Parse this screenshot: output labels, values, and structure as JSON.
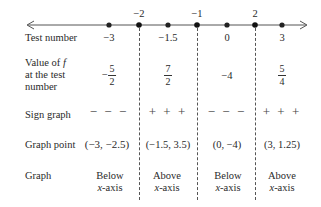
{
  "number_line": {
    "critical_labels": [
      "−2",
      "−1",
      "2"
    ],
    "points": [
      -3,
      -2,
      -1.5,
      -1,
      0,
      2,
      3
    ]
  },
  "rows": {
    "test_number": {
      "label": "Test number",
      "values": [
        "−3",
        "−1.5",
        "0",
        "3"
      ]
    },
    "value_of_f": {
      "label_line1": "Value of",
      "label_f": "f",
      "label_line2": "at the test",
      "label_line3": "number",
      "values": [
        {
          "sign": "−",
          "num": "5",
          "den": "2"
        },
        {
          "sign": "",
          "num": "7",
          "den": "2"
        },
        {
          "plain": "−4"
        },
        {
          "sign": "",
          "num": "5",
          "den": "4"
        }
      ]
    },
    "sign_graph": {
      "label": "Sign graph",
      "values": [
        "− − −",
        "+ + +",
        "− − −",
        "+ + +"
      ]
    },
    "graph_point": {
      "label": "Graph point",
      "values": [
        "(−3, −2.5)",
        "(−1.5, 3.5)",
        "(0, −4)",
        "(3, 1.25)"
      ]
    },
    "graph": {
      "label": "Graph",
      "values": [
        {
          "line1": "Below",
          "line2": "x-axis"
        },
        {
          "line1": "Above",
          "line2": "x-axis"
        },
        {
          "line1": "Below",
          "line2": "x-axis"
        },
        {
          "line1": "Above",
          "line2": "x-axis"
        }
      ]
    }
  }
}
